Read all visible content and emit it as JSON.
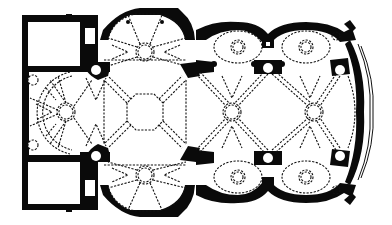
{
  "figure": {
    "type": "architectural-floor-plan",
    "colors": {
      "ink": "#0a0a0a",
      "background": "#ffffff"
    },
    "elements": {
      "left_rooms": [
        {
          "name": "upper-sacristy",
          "x": 22,
          "y": 15,
          "w": 76,
          "h": 55
        },
        {
          "name": "lower-sacristy",
          "x": 22,
          "y": 155,
          "w": 76,
          "h": 55
        }
      ],
      "apse_left": {
        "cx": 66,
        "cy": 112,
        "r": 42
      },
      "chapels": [
        {
          "name": "north-octagon",
          "cx": 145,
          "cy": 50,
          "r": 38
        },
        {
          "name": "south-octagon",
          "cx": 145,
          "cy": 176,
          "r": 38
        }
      ],
      "crossing_octagon": {
        "cx": 145,
        "cy": 112,
        "r": 22
      },
      "nave_circles": [
        {
          "cx": 232,
          "cy": 112,
          "r": 9
        },
        {
          "cx": 314,
          "cy": 112,
          "r": 9
        }
      ],
      "side_bays_top": [
        {
          "cx": 238,
          "cy": 47,
          "rx": 24,
          "ry": 17
        },
        {
          "cx": 306,
          "cy": 47,
          "rx": 24,
          "ry": 17
        }
      ],
      "side_bays_bottom": [
        {
          "cx": 238,
          "cy": 177,
          "rx": 24,
          "ry": 17
        },
        {
          "cx": 306,
          "cy": 177,
          "rx": 24,
          "ry": 17
        }
      ],
      "apse_right": {
        "x_end": 362
      }
    }
  }
}
